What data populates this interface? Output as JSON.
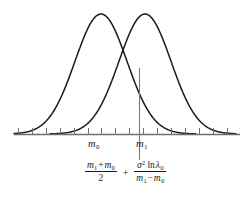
{
  "figure": {
    "caption": "",
    "axis": {
      "label_m0": "m",
      "label_m0_sub": "0",
      "label_m1": "m",
      "label_m1_sub": "1"
    },
    "formula": {
      "left_fraction": {
        "numerator_m1": "m",
        "numerator_m1_sub": "1",
        "numerator_plus": "+",
        "numerator_m0": "m",
        "numerator_m0_sub": "0",
        "denominator": "2"
      },
      "operator": "+",
      "right_fraction": {
        "numerator_sigma": "σ",
        "numerator_sigma_sup": "2",
        "numerator_ln": "ln",
        "numerator_lambda": "λ",
        "numerator_lambda_sub": "0",
        "denominator_m1": "m",
        "denominator_m1_sub": "1",
        "denominator_minus": "−",
        "denominator_m0": "m",
        "denominator_m0_sub": "0"
      }
    },
    "colors": {
      "curve": "#1a1a1a",
      "axis": "#6e6e6e",
      "threshold_line": "#7a7a7a",
      "text": "#1a1a1a",
      "background": "#ffffff"
    }
  },
  "chart_data": {
    "type": "line",
    "title": "",
    "subtitle": "",
    "xlabel": "",
    "ylabel": "",
    "grid": false,
    "legend_position": "none",
    "xlim": [
      0,
      251
    ],
    "ylim": [
      0,
      1
    ],
    "axis_y_pixel": 134,
    "tick_positions": [
      18,
      32,
      46,
      60,
      74,
      88,
      101,
      115,
      129,
      143,
      157,
      171,
      185,
      199,
      213,
      227
    ],
    "annotations": [
      {
        "name": "m0-label",
        "text": "m₀",
        "x": 101,
        "y": 146
      },
      {
        "name": "m1-label",
        "text": "m₁",
        "x": 145,
        "y": 146
      },
      {
        "name": "threshold-line",
        "x": 139,
        "y_top": 68,
        "y_bottom": 160
      }
    ],
    "series": [
      {
        "name": "gaussian-m0",
        "mean": 101,
        "sigma": 26,
        "peak_x": 101,
        "peak_y_pixel": 14,
        "baseline_y_pixel": 134,
        "x_start": 14,
        "x_end": 196
      },
      {
        "name": "gaussian-m1",
        "mean": 145,
        "sigma": 26,
        "peak_x": 145,
        "peak_y_pixel": 14,
        "baseline_y_pixel": 134,
        "x_start": 50,
        "x_end": 236
      }
    ]
  }
}
